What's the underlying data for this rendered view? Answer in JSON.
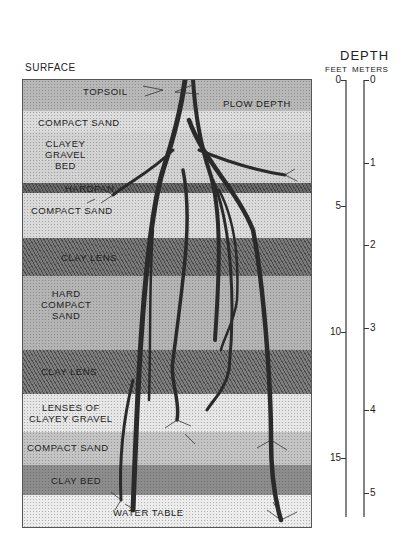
{
  "diagram": {
    "surface_label": "SURFACE",
    "layers": [
      {
        "name": "topsoil",
        "label": "TOPSOIL",
        "top": 0,
        "height": 31,
        "color": "#b8b8b8"
      },
      {
        "name": "compact-sand-1",
        "label": "COMPACT SAND",
        "top": 31,
        "height": 21,
        "color": "#dcdcdc"
      },
      {
        "name": "clayey-gravel-bed",
        "label": "CLAYEY\nGRAVEL\nBED",
        "top": 52,
        "height": 51,
        "color": "#d2d2d2"
      },
      {
        "name": "hardpan",
        "label": "HARDPAN",
        "top": 103,
        "height": 10,
        "color": "#6a6a6a"
      },
      {
        "name": "compact-sand-2",
        "label": "COMPACT SAND",
        "top": 113,
        "height": 45,
        "color": "#dadada"
      },
      {
        "name": "clay-lens-1",
        "label": "CLAY LENS",
        "top": 158,
        "height": 38,
        "color": "#7a7a7a"
      },
      {
        "name": "hard-compact-sand",
        "label": "HARD\nCOMPACT\nSAND",
        "top": 196,
        "height": 74,
        "color": "#b4b4b4"
      },
      {
        "name": "clay-lens-2",
        "label": "CLAY LENS",
        "top": 270,
        "height": 44,
        "color": "#7e7e7e"
      },
      {
        "name": "lenses-of-clayey-gravel",
        "label": "LENSES OF\nCLAYEY GRAVEL",
        "top": 314,
        "height": 38,
        "color": "#e6e6e6"
      },
      {
        "name": "compact-sand-3",
        "label": "COMPACT SAND",
        "top": 352,
        "height": 33,
        "color": "#c4c4c4"
      },
      {
        "name": "clay-bed",
        "label": "CLAY BED",
        "top": 385,
        "height": 30,
        "color": "#8c8c8c"
      },
      {
        "name": "water-table",
        "label": "WATER TABLE",
        "top": 415,
        "height": 34,
        "color": "#ececec"
      }
    ],
    "annotations": {
      "plow_depth": "PLOW DEPTH"
    }
  },
  "scale": {
    "title": "DEPTH",
    "feet_label": "FEET",
    "meters_label": "METERS",
    "feet_ticks": [
      "0",
      "5",
      "10",
      "15"
    ],
    "meters_ticks": [
      "0",
      "1",
      "2",
      "3",
      "4",
      "5"
    ]
  }
}
